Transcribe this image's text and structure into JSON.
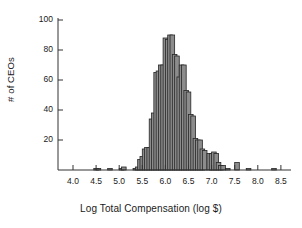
{
  "chart_data": {
    "type": "bar",
    "title": "",
    "subtitle": "",
    "xlabel": "Log Total Compensation (log $)",
    "ylabel": "# of CEOs",
    "xlim": [
      3.85,
      8.65
    ],
    "ylim": [
      0,
      104
    ],
    "grid": false,
    "legend": null,
    "bin_width": 0.1,
    "xticks": [
      "4.0",
      "4.5",
      "5.0",
      "5.5",
      "6.0",
      "6.5",
      "7.0",
      "7.5",
      "8.0",
      "8.5"
    ],
    "xtick_values": [
      4.0,
      4.5,
      5.0,
      5.5,
      6.0,
      6.5,
      7.0,
      7.5,
      8.0,
      8.5
    ],
    "yticks": [
      "20",
      "40",
      "60",
      "80",
      "100"
    ],
    "ytick_values": [
      20,
      40,
      60,
      80,
      100
    ],
    "bins": [
      {
        "x": 4.45,
        "value": 1
      },
      {
        "x": 4.5,
        "value": 1
      },
      {
        "x": 4.75,
        "value": 1
      },
      {
        "x": 5.0,
        "value": 1
      },
      {
        "x": 5.05,
        "value": 2
      },
      {
        "x": 5.3,
        "value": 1
      },
      {
        "x": 5.35,
        "value": 2
      },
      {
        "x": 5.4,
        "value": 7
      },
      {
        "x": 5.45,
        "value": 9
      },
      {
        "x": 5.5,
        "value": 14
      },
      {
        "x": 5.55,
        "value": 15
      },
      {
        "x": 5.6,
        "value": 15
      },
      {
        "x": 5.65,
        "value": 34
      },
      {
        "x": 5.7,
        "value": 38
      },
      {
        "x": 5.75,
        "value": 65
      },
      {
        "x": 5.8,
        "value": 66
      },
      {
        "x": 5.85,
        "value": 70
      },
      {
        "x": 5.9,
        "value": 70
      },
      {
        "x": 5.95,
        "value": 88
      },
      {
        "x": 6.0,
        "value": 87
      },
      {
        "x": 6.05,
        "value": 90
      },
      {
        "x": 6.1,
        "value": 90
      },
      {
        "x": 6.15,
        "value": 77
      },
      {
        "x": 6.2,
        "value": 76
      },
      {
        "x": 6.25,
        "value": 62
      },
      {
        "x": 6.3,
        "value": 70
      },
      {
        "x": 6.35,
        "value": 70
      },
      {
        "x": 6.4,
        "value": 53
      },
      {
        "x": 6.45,
        "value": 52
      },
      {
        "x": 6.5,
        "value": 37
      },
      {
        "x": 6.55,
        "value": 36
      },
      {
        "x": 6.6,
        "value": 21
      },
      {
        "x": 6.65,
        "value": 20
      },
      {
        "x": 6.7,
        "value": 20
      },
      {
        "x": 6.75,
        "value": 14
      },
      {
        "x": 6.8,
        "value": 13
      },
      {
        "x": 6.9,
        "value": 11
      },
      {
        "x": 6.95,
        "value": 11
      },
      {
        "x": 7.0,
        "value": 12
      },
      {
        "x": 7.05,
        "value": 11
      },
      {
        "x": 7.1,
        "value": 5
      },
      {
        "x": 7.15,
        "value": 3
      },
      {
        "x": 7.2,
        "value": 3
      },
      {
        "x": 7.3,
        "value": 1
      },
      {
        "x": 7.5,
        "value": 5
      },
      {
        "x": 7.75,
        "value": 1
      },
      {
        "x": 8.3,
        "value": 1
      }
    ],
    "colors": {
      "bar_fill": "#8c8c8c",
      "bar_edge": "#262626",
      "axis": "#333333",
      "text": "#1a1a1a",
      "background": "#ffffff"
    }
  }
}
